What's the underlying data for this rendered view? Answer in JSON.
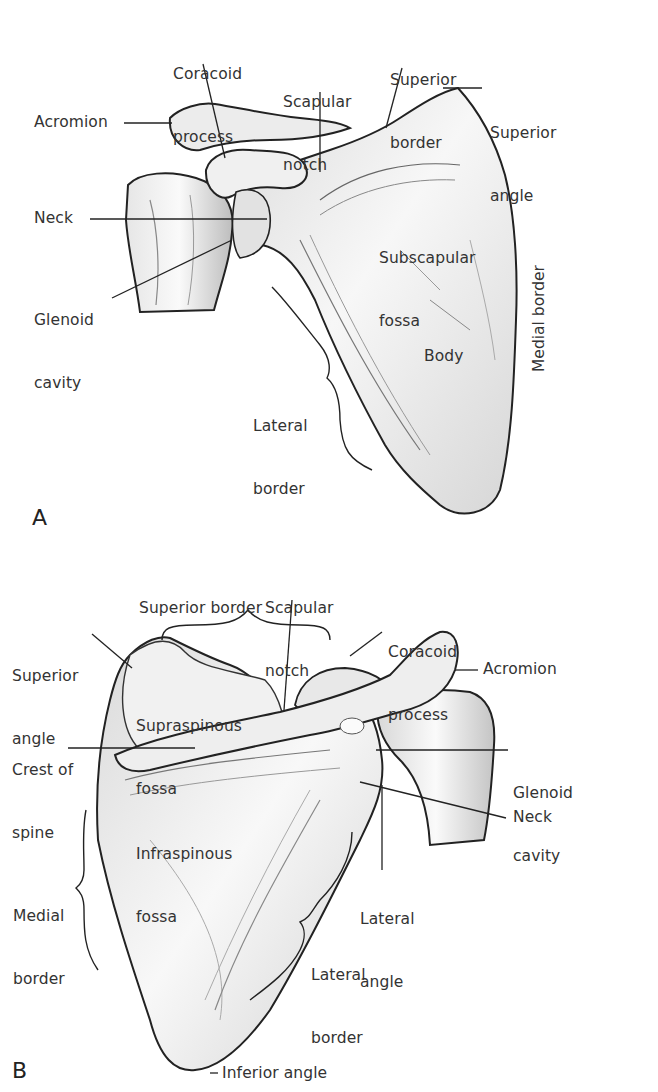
{
  "figure": {
    "ink_color": "#222222",
    "bone_fill": "#f2f2f2",
    "bone_shade": "#c9c9c9"
  },
  "panel_a": {
    "letter": "A",
    "view": "anterior",
    "labels": {
      "coracoid_process": [
        "Coracoid",
        "process"
      ],
      "scapular_notch": [
        "Scapular",
        "notch"
      ],
      "superior_border": [
        "Superior",
        "border"
      ],
      "superior_angle": [
        "Superior",
        "angle"
      ],
      "acromion": "Acromion",
      "neck": "Neck",
      "glenoid_cavity": [
        "Glenoid",
        "cavity"
      ],
      "subscapular_fossa": [
        "Subscapular",
        "fossa"
      ],
      "medial_border": "Medial border",
      "body": "Body",
      "lateral_border": [
        "Lateral",
        "border"
      ]
    }
  },
  "panel_b": {
    "letter": "B",
    "view": "posterior",
    "labels": {
      "scapular_notch": [
        "Scapular",
        "notch"
      ],
      "superior_border": "Superior border",
      "coracoid_process": [
        "Coracoid",
        "process"
      ],
      "superior_angle": [
        "Superior",
        "angle"
      ],
      "acromion": "Acromion",
      "supraspinous_fossa": [
        "Supraspinous",
        "fossa"
      ],
      "crest_of_spine": [
        "Crest of",
        "spine"
      ],
      "glenoid_cavity": [
        "Glenoid",
        "cavity"
      ],
      "neck": "Neck",
      "infraspinous_fossa": [
        "Infraspinous",
        "fossa"
      ],
      "medial_border": [
        "Medial",
        "border"
      ],
      "lateral_angle": [
        "Lateral",
        "angle"
      ],
      "lateral_border": [
        "Lateral",
        "border"
      ],
      "inferior_angle": "Inferior angle"
    }
  }
}
